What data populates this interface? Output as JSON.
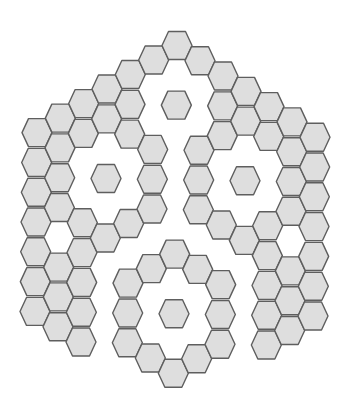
{
  "figure": {
    "title": "",
    "colors": {
      "background": "#ffffff",
      "hex_fill": "#dedede",
      "hex_stroke": "#5e5e5e"
    },
    "grid": {
      "origin_x": 177,
      "origin_y": 45.5,
      "col_dx": 23,
      "col_dy": 15.28,
      "row_dx": -0.333,
      "row_dy": 29.8,
      "hex_half_width": 15,
      "hex_half_height": 14,
      "hex_top_half": 8.5
    },
    "columns": [
      {
        "c": -6,
        "rows": [
          6,
          7,
          8,
          9,
          10,
          11,
          12
        ]
      },
      {
        "c": -5,
        "rows": [
          5,
          6,
          7,
          8,
          10,
          11,
          12
        ]
      },
      {
        "c": -4,
        "rows": [
          4,
          5,
          8,
          9,
          10,
          11,
          12
        ]
      },
      {
        "c": -3,
        "rows": [
          3,
          4,
          6,
          8
        ]
      },
      {
        "c": -2,
        "rows": [
          2,
          3,
          4,
          7,
          9,
          10,
          11
        ]
      },
      {
        "c": -1,
        "rows": [
          1,
          4,
          5,
          6,
          8,
          11
        ]
      },
      {
        "c": 0,
        "rows": [
          0,
          2,
          7,
          9,
          11
        ]
      },
      {
        "c": 1,
        "rows": [
          0,
          3,
          4,
          5,
          7,
          10
        ]
      },
      {
        "c": 2,
        "rows": [
          0,
          1,
          2,
          5,
          7,
          8,
          9
        ]
      },
      {
        "c": 3,
        "rows": [
          0,
          1,
          3,
          5
        ]
      },
      {
        "c": 4,
        "rows": [
          0,
          1,
          4,
          5,
          6,
          7,
          8
        ]
      },
      {
        "c": 5,
        "rows": [
          0,
          1,
          2,
          3,
          5,
          6,
          7
        ]
      },
      {
        "c": 6,
        "rows": [
          0,
          1,
          2,
          3,
          4,
          5,
          6
        ]
      }
    ],
    "ring_centers": [
      {
        "name": "top",
        "c": 0,
        "r": 2
      },
      {
        "name": "left",
        "c": -3,
        "r": 6
      },
      {
        "name": "right",
        "c": 3,
        "r": 3
      },
      {
        "name": "bottom",
        "c": 0,
        "r": 9
      }
    ],
    "hex_count": 81
  }
}
